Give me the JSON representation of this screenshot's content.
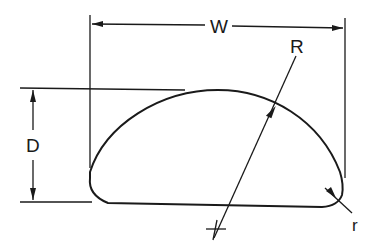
{
  "diagram": {
    "title": "",
    "type": "dimensioned cross-section",
    "labels": {
      "width": "W",
      "depth": "D",
      "major_radius": "R",
      "corner_radius": "r"
    },
    "colors": {
      "ink": "#1a1a1a",
      "background": "#ffffff"
    }
  }
}
